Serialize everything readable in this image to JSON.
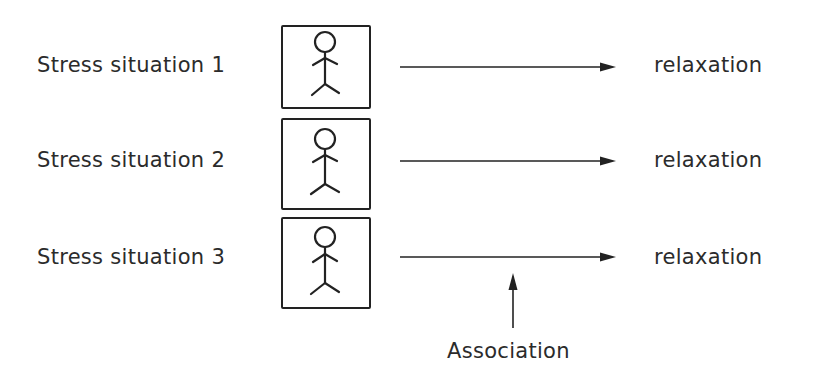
{
  "diagram": {
    "rows": [
      {
        "stimulus_label": "Stress situation 1",
        "figure_icon": "stick-figure-icon",
        "response_label": "relaxation"
      },
      {
        "stimulus_label": "Stress situation 2",
        "figure_icon": "stick-figure-icon",
        "response_label": "relaxation"
      },
      {
        "stimulus_label": "Stress situation 3",
        "figure_icon": "stick-figure-icon",
        "response_label": "relaxation"
      }
    ],
    "pointer": {
      "label": "Association",
      "icon": "arrow-up-icon"
    },
    "colors": {
      "stroke": "#222222",
      "text": "#2b2b2b",
      "background": "#ffffff"
    }
  }
}
